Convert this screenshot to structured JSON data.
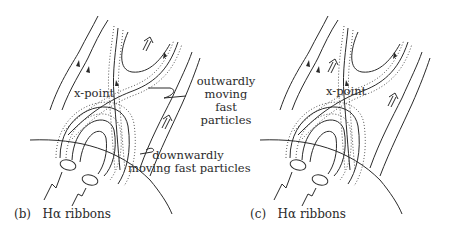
{
  "panels": [
    {
      "id": "b",
      "caption_tag": "(b)",
      "caption_text": "Hα ribbons",
      "xpoint_label": "x-point",
      "annotations": [
        {
          "text_lines": [
            "outwardly",
            "moving",
            "fast",
            "particles"
          ]
        },
        {
          "text_lines": [
            "downwardly",
            "moving fast particles"
          ]
        }
      ]
    },
    {
      "id": "c",
      "caption_tag": "(c)",
      "caption_text": "Hα ribbons",
      "xpoint_label": "x-point"
    }
  ],
  "colors": {
    "ink": "#2a2a2a",
    "background": "#ffffff"
  }
}
